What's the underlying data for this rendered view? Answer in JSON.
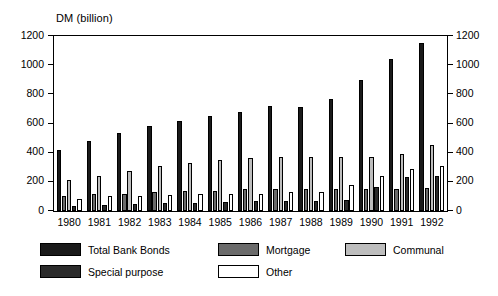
{
  "chart_data": {
    "type": "bar",
    "title": "DM (billion)",
    "xlabel": "",
    "ylabel": "DM (billion)",
    "ylim": [
      0,
      1200
    ],
    "yticks": [
      0,
      200,
      400,
      600,
      800,
      1000,
      1200
    ],
    "ytick_labels": [
      "0",
      "200",
      "400",
      "600",
      "800",
      "1000",
      "1200"
    ],
    "grid": false,
    "legend_position": "bottom",
    "dual_axis": true,
    "categories": [
      "1980",
      "1981",
      "1982",
      "1983",
      "1984",
      "1985",
      "1986",
      "1987",
      "1988",
      "1989",
      "1990",
      "1991",
      "1992"
    ],
    "series": [
      {
        "name": "Total Bank Bonds",
        "color": "#1a1a1a",
        "values": [
          415,
          480,
          535,
          585,
          620,
          650,
          680,
          720,
          715,
          765,
          895,
          1040,
          1150
        ]
      },
      {
        "name": "Mortgage",
        "color": "#6b6b6b",
        "values": [
          105,
          115,
          120,
          128,
          135,
          140,
          148,
          150,
          148,
          150,
          148,
          152,
          160
        ]
      },
      {
        "name": "Communal",
        "color": "#bdbdbd",
        "values": [
          210,
          240,
          275,
          310,
          330,
          350,
          365,
          368,
          370,
          368,
          370,
          392,
          452
        ]
      },
      {
        "name": "Special purpose",
        "color": "#2b2b2b",
        "values": [
          35,
          38,
          45,
          55,
          58,
          62,
          70,
          72,
          68,
          78,
          165,
          232,
          240
        ]
      },
      {
        "name": "Other",
        "color": "#ffffff",
        "values": [
          85,
          100,
          105,
          110,
          115,
          118,
          120,
          128,
          132,
          175,
          242,
          285,
          310
        ]
      }
    ]
  },
  "legend": {
    "entries": [
      {
        "label": "Total Bank Bonds",
        "swatch": "#1a1a1a"
      },
      {
        "label": "Mortgage",
        "swatch": "#6b6b6b"
      },
      {
        "label": "Communal",
        "swatch": "#bdbdbd"
      },
      {
        "label": "Special purpose",
        "swatch": "#2b2b2b"
      },
      {
        "label": "Other",
        "swatch": "#ffffff"
      }
    ]
  }
}
